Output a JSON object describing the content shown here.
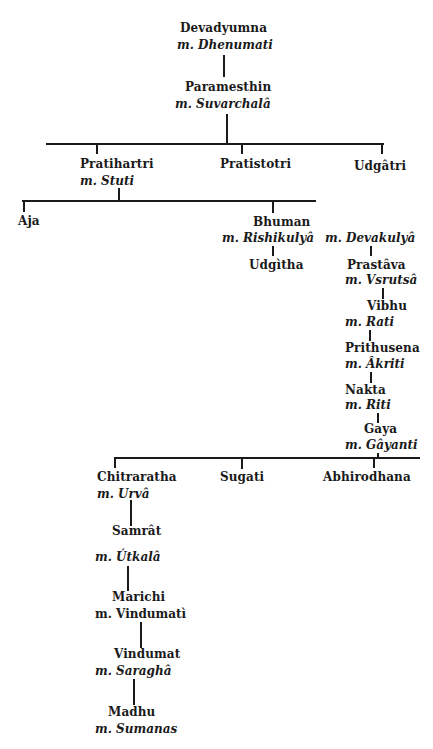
{
  "diagram": {
    "type": "genealogy-tree",
    "nodes": {
      "devadyumna": {
        "name": "Devadyumna",
        "spouse": "m. Dhenumati"
      },
      "paramesthin": {
        "name": "Paramesthin",
        "spouse": "m. Suvarchalâ"
      },
      "pratihartri": {
        "name": "Pratihartri",
        "spouse": "m. Stuti"
      },
      "pratistotri": {
        "name": "Pratistotri"
      },
      "udgatri": {
        "name": "Udgâtri"
      },
      "aja": {
        "name": "Aja"
      },
      "bhuman": {
        "name": "Bhuman",
        "spouse": "m. Rishikulyâ",
        "spouse2": "m. Devakulyâ"
      },
      "udgitha": {
        "name": "Udgìtha"
      },
      "prastava": {
        "name": "Prastâva",
        "spouse": "m. Vsrutsâ"
      },
      "vibhu": {
        "name": "Vibhu",
        "spouse": "m. Rati"
      },
      "prithusena": {
        "name": "Prithusena",
        "spouse": "m. Âkriti"
      },
      "nakta": {
        "name": "Nakta",
        "spouse": "m. Riti"
      },
      "gaya": {
        "name": "Gaya",
        "spouse": "m. Gâyanti"
      },
      "chitraratha": {
        "name": "Chitraratha",
        "spouse": "m. Urvâ"
      },
      "sugati": {
        "name": "Sugati"
      },
      "abhirodhana": {
        "name": "Abhirodhana"
      },
      "samrat": {
        "name": "Samrât",
        "spouse": "m. Útkalâ"
      },
      "marichi": {
        "name": "Marichi",
        "spouse": "m. Vindumatì"
      },
      "vindumat": {
        "name": "Vindumat",
        "spouse": "m. Saraghâ"
      },
      "madhu": {
        "name": "Madhu",
        "spouse": "m. Sumanas"
      }
    },
    "edges": [
      [
        "Devadyumna",
        "Paramesthin"
      ],
      [
        "Paramesthin",
        "Pratihartri"
      ],
      [
        "Paramesthin",
        "Pratistotri"
      ],
      [
        "Paramesthin",
        "Udgâtri"
      ],
      [
        "Pratihartri",
        "Aja"
      ],
      [
        "Pratihartri",
        "Bhuman"
      ],
      [
        "Bhuman",
        "Udgìtha"
      ],
      [
        "Bhuman",
        "Prastâva"
      ],
      [
        "Prastâva",
        "Vibhu"
      ],
      [
        "Vibhu",
        "Prithusena"
      ],
      [
        "Prithusena",
        "Nakta"
      ],
      [
        "Nakta",
        "Gaya"
      ],
      [
        "Gaya",
        "Chitraratha"
      ],
      [
        "Gaya",
        "Sugati"
      ],
      [
        "Gaya",
        "Abhirodhana"
      ],
      [
        "Chitraratha",
        "Samrât"
      ],
      [
        "Samrât",
        "Marichi"
      ],
      [
        "Marichi",
        "Vindumat"
      ],
      [
        "Vindumat",
        "Madhu"
      ]
    ]
  }
}
